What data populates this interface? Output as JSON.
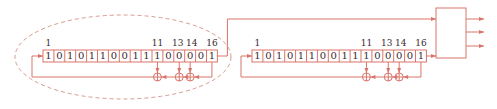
{
  "colors": {
    "line": "#d9746a",
    "dashed": "#d99a8e",
    "text": "#3a2a2a",
    "background": "#ffffff"
  },
  "registers": [
    {
      "name": "left-lfsr",
      "x": 43,
      "y": 50,
      "cell_width": 10.9,
      "cell_height": 12,
      "bits": [
        "1",
        "0",
        "1",
        "0",
        "1",
        "1",
        "0",
        "0",
        "1",
        "1",
        "1",
        "0",
        "0",
        "0",
        "0",
        "1"
      ],
      "tap_labels": [
        {
          "text": "1",
          "cell": 1
        },
        {
          "text": "11",
          "cell": 11
        },
        {
          "text": "13",
          "cell": 13
        },
        {
          "text": "14",
          "cell": 14
        },
        {
          "text": "16",
          "cell": 16
        }
      ],
      "xor_taps": [
        11,
        13,
        14
      ]
    },
    {
      "name": "right-lfsr",
      "x": 252,
      "y": 50,
      "cell_width": 10.9,
      "cell_height": 12,
      "bits": [
        "1",
        "0",
        "1",
        "0",
        "1",
        "1",
        "0",
        "0",
        "1",
        "1",
        "1",
        "0",
        "0",
        "0",
        "0",
        "1"
      ],
      "tap_labels": [
        {
          "text": "1",
          "cell": 1
        },
        {
          "text": "11",
          "cell": 11
        },
        {
          "text": "13",
          "cell": 13
        },
        {
          "text": "14",
          "cell": 14
        },
        {
          "text": "16",
          "cell": 16
        }
      ],
      "xor_taps": [
        11,
        13,
        14
      ]
    }
  ],
  "combiner_box": {
    "x": 436,
    "y": 8,
    "w": 30,
    "h": 50,
    "outputs": 3
  },
  "highlight": {
    "shape": "dashed-ellipse",
    "cx": 123,
    "cy": 57,
    "rx": 108,
    "ry": 42
  }
}
